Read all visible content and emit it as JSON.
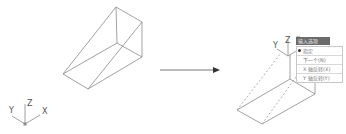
{
  "figure": {
    "before": {
      "ucs_labels": {
        "x": "X",
        "y": "Y",
        "z": "Z"
      }
    },
    "after": {
      "ucs_labels": {
        "x": "X",
        "y": "Y",
        "z": "Z"
      },
      "menu": {
        "title": "输入选项",
        "items": [
          {
            "label": "指定",
            "selected": true
          },
          {
            "label": "下一个(N)",
            "selected": false
          },
          {
            "label": "X 轴反转(X)",
            "selected": false
          },
          {
            "label": "Y 轴反转(Y)",
            "selected": false
          }
        ]
      }
    },
    "colors": {
      "line": "#8a8a8a",
      "arrow": "#555555",
      "menu_title_bg": "#6b6b6b"
    }
  }
}
